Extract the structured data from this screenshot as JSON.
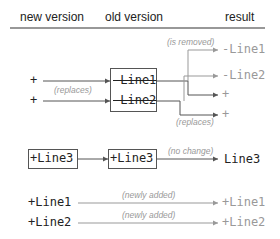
{
  "header": {
    "new_version": "new version",
    "old_version": "old version",
    "result": "result"
  },
  "section_replace": {
    "new": [
      "+",
      "+"
    ],
    "new_note": "(replaces)",
    "old": [
      "-Line1",
      "-Line2"
    ],
    "result_removed_note": "(is removed)",
    "result_replaces_note": "(replaces)",
    "results": [
      "-Line1",
      "-Line2",
      "+",
      "+"
    ]
  },
  "section_unchanged": {
    "new": "+Line3",
    "old": "+Line3",
    "note": "(no change)",
    "result": "Line3"
  },
  "section_added": {
    "rows": [
      {
        "new": "+Line1",
        "note": "(newly added)",
        "result": "+Line1"
      },
      {
        "new": "+Line2",
        "note": "(newly added)",
        "result": "+Line2"
      }
    ]
  },
  "colors": {
    "text": "#222222",
    "muted": "#999999",
    "line": "#555555"
  }
}
